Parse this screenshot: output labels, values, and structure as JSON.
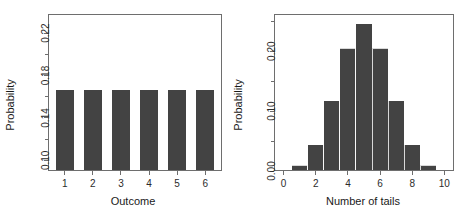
{
  "figure": {
    "background_color": "#ffffff",
    "bar_color": "#434343",
    "axis_color": "#6e6e6e",
    "panel_count": 2
  },
  "chart_data": [
    {
      "type": "bar",
      "panel": "left",
      "title": "",
      "xlabel": "Outcome",
      "ylabel": "Probability",
      "categories": [
        "1",
        "2",
        "3",
        "4",
        "5",
        "6"
      ],
      "x": [
        1,
        2,
        3,
        4,
        5,
        6
      ],
      "values": [
        0.1667,
        0.1667,
        0.1667,
        0.1667,
        0.1667,
        0.1667
      ],
      "xlim": [
        0.4,
        6.6
      ],
      "ylim": [
        0.09,
        0.238
      ],
      "xticks": [
        1,
        2,
        3,
        4,
        5,
        6
      ],
      "xticklabels": [
        "1",
        "2",
        "3",
        "4",
        "5",
        "6"
      ],
      "yticks": [
        0.1,
        0.14,
        0.18,
        0.22
      ],
      "yticklabels": [
        "0.10",
        "0.14",
        "0.18",
        "0.22"
      ],
      "yminorticks": [
        0.12,
        0.16,
        0.2
      ],
      "grid": false,
      "legend": false,
      "bar_style": "separated"
    },
    {
      "type": "bar",
      "panel": "right",
      "title": "",
      "xlabel": "Number of tails",
      "ylabel": "Probability",
      "categories": [
        "0",
        "1",
        "2",
        "3",
        "4",
        "5",
        "6",
        "7",
        "8",
        "9",
        "10"
      ],
      "x": [
        0,
        1,
        2,
        3,
        4,
        5,
        6,
        7,
        8,
        9,
        10
      ],
      "values": [
        0.001,
        0.01,
        0.044,
        0.117,
        0.205,
        0.246,
        0.205,
        0.117,
        0.044,
        0.01,
        0.001
      ],
      "xlim": [
        -0.6,
        10.6
      ],
      "ylim": [
        0.0,
        0.262
      ],
      "xticks": [
        0,
        2,
        4,
        6,
        8,
        10
      ],
      "xticklabels": [
        "0",
        "2",
        "4",
        "6",
        "8",
        "10"
      ],
      "yticks": [
        0.0,
        0.1,
        0.2
      ],
      "yticklabels": [
        "0.00",
        "0.10",
        "0.20"
      ],
      "yminorticks": [
        0.05,
        0.15,
        0.25
      ],
      "grid": false,
      "legend": false,
      "bar_style": "contiguous"
    }
  ]
}
